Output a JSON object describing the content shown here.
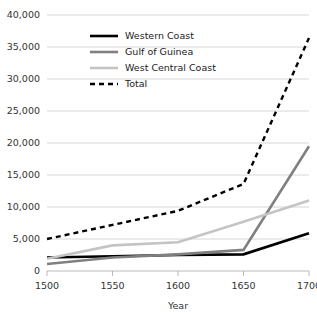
{
  "chart_data": {
    "type": "line",
    "title": "",
    "xlabel": "Year",
    "ylabel": "",
    "x": [
      1500,
      1550,
      1600,
      1650,
      1700
    ],
    "xlim": [
      1500,
      1700
    ],
    "ylim": [
      0,
      40000
    ],
    "grid": true,
    "legend_position": "upper-left-inside",
    "y_ticks": [
      0,
      5000,
      10000,
      15000,
      20000,
      25000,
      30000,
      35000,
      40000
    ],
    "y_tick_labels": [
      "0",
      "5,000",
      "10,000",
      "15,000",
      "20,000",
      "25,000",
      "30,000",
      "35,000",
      "40,000"
    ],
    "x_ticks": [
      1500,
      1550,
      1600,
      1650,
      1700
    ],
    "x_tick_labels": [
      "1500",
      "1550",
      "1600",
      "1650",
      "1700"
    ],
    "series": [
      {
        "name": "Western Coast",
        "color": "#000000",
        "style": "solid",
        "width": 2.6,
        "values": [
          2100,
          2300,
          2500,
          2600,
          5900
        ]
      },
      {
        "name": "Gulf of Guinea",
        "color": "#808080",
        "style": "solid",
        "width": 2.6,
        "values": [
          1100,
          2100,
          2600,
          3300,
          19500
        ]
      },
      {
        "name": "West Central Coast",
        "color": "#c4c4c4",
        "style": "solid",
        "width": 2.6,
        "values": [
          1900,
          4000,
          4500,
          7700,
          11000
        ]
      },
      {
        "name": "Total",
        "color": "#000000",
        "style": "dashed",
        "width": 2.4,
        "values": [
          5000,
          7200,
          9400,
          13600,
          36400
        ]
      }
    ]
  },
  "legend": {
    "items": [
      {
        "label": "Western Coast"
      },
      {
        "label": "Gulf of Guinea"
      },
      {
        "label": "West Central Coast"
      },
      {
        "label": "Total"
      }
    ]
  },
  "axes": {
    "x_title": "Year"
  }
}
